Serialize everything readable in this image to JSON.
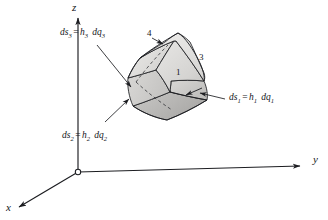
{
  "figure": {
    "background_color": "#ffffff",
    "line_color": "#1c1d21",
    "text_color": "#15161a"
  },
  "axes": {
    "z_label": "z",
    "y_label": "y",
    "x_label": "x",
    "origin_marker": "origin-circle"
  },
  "element": {
    "face_light_color": "#e4e3e1",
    "face_mid_color": "#d2d1cf",
    "face_dark_color": "#b4b3b1",
    "edge_color": "#1c1d21"
  },
  "labels": {
    "ds3": {
      "lhs": "ds",
      "lhs_sub": "3",
      "eq": "=",
      "h": "h",
      "h_sub": "3",
      "dq": "dq",
      "dq_sub": "3"
    },
    "ds2": {
      "lhs": "ds",
      "lhs_sub": "2",
      "eq": "=",
      "h": "h",
      "h_sub": "2",
      "dq": "dq",
      "dq_sub": "2"
    },
    "ds1": {
      "lhs": "ds",
      "lhs_sub": "1",
      "eq": "=",
      "h": "h",
      "h_sub": "1",
      "dq": "dq",
      "dq_sub": "1"
    }
  },
  "face_numbers": {
    "n1": "1",
    "n3": "3",
    "n4": "4"
  }
}
